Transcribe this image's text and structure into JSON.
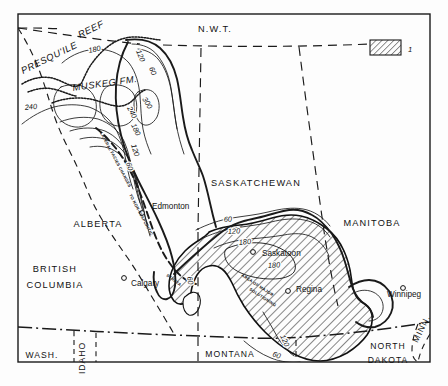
{
  "map": {
    "title": "Isopach map of Middle Devonian Elk Point evaporites, Western Canada Sedimentary Basin",
    "frame": {
      "x": 18,
      "y": 14,
      "width": 412,
      "height": 348
    },
    "legend": {
      "swatch_pattern": "diagonal-hatch",
      "label": "1"
    },
    "provinces": [
      {
        "name": "N.W.T.",
        "x": 215,
        "y": 32,
        "cls": "prov-label",
        "anchor": "middle"
      },
      {
        "name": "SASKATCHEWAN",
        "x": 256,
        "y": 186,
        "cls": "prov-label",
        "anchor": "middle"
      },
      {
        "name": "MANITOBA",
        "x": 372,
        "y": 226,
        "cls": "prov-label",
        "anchor": "middle"
      },
      {
        "name": "ALBERTA",
        "x": 98,
        "y": 227,
        "cls": "prov-label",
        "anchor": "middle"
      }
    ],
    "regions": [
      {
        "name": "BRITISH",
        "x": 55,
        "y": 272,
        "cls": "prov-label",
        "anchor": "middle"
      },
      {
        "name": "COLUMBIA",
        "x": 55,
        "y": 288,
        "cls": "prov-label",
        "anchor": "middle"
      }
    ],
    "states": [
      {
        "name": "WASH.",
        "x": 42,
        "y": 358,
        "cls": "state-label",
        "anchor": "middle"
      },
      {
        "name": "MONTANA",
        "x": 230,
        "y": 357,
        "cls": "state-label",
        "anchor": "middle",
        "spacing": 4.5
      },
      {
        "name": "NORTH",
        "x": 388,
        "y": 349,
        "cls": "state-label",
        "anchor": "middle"
      },
      {
        "name": "DAKOTA",
        "x": 388,
        "y": 363,
        "cls": "state-label",
        "anchor": "middle"
      }
    ],
    "rotated_states": [
      {
        "name": "IDAHO",
        "x": 85,
        "y": 358,
        "rotate": -90,
        "cls": "state-label"
      },
      {
        "name": "MINN.",
        "x": 424,
        "y": 330,
        "rotate": -64,
        "cls": "state-label"
      }
    ],
    "cities": [
      {
        "name": "Edmonton",
        "x": 152,
        "y": 209,
        "dot_x": 142,
        "dot_y": 213
      },
      {
        "name": "Calgary",
        "x": 131,
        "y": 286,
        "dot_x": 124,
        "dot_y": 278
      },
      {
        "name": "Saskatoon",
        "x": 262,
        "y": 256,
        "dot_x": 253,
        "dot_y": 252
      },
      {
        "name": "Regina",
        "x": 296,
        "y": 292,
        "dot_x": 288,
        "dot_y": 291
      },
      {
        "name": "Winnipeg",
        "x": 387,
        "y": 297,
        "dot_x": 403,
        "dot_y": 288
      }
    ],
    "features": [
      {
        "name": "PRESQU'ILE",
        "x": 23,
        "y": 74,
        "rotate": -26,
        "cls": "feature-label"
      },
      {
        "name": "REEF",
        "x": 80,
        "y": 38,
        "rotate": -26,
        "cls": "feature-label"
      },
      {
        "name": "MUSKEG FM.",
        "x": 73,
        "y": 91,
        "rotate": -8,
        "cls": "feature-label"
      }
    ],
    "annotations": [
      {
        "name": "LATERAL FACIES CHANGES",
        "x": 100,
        "y": 133,
        "rotate": 62,
        "cls": "tiny-label"
      },
      {
        "name": "TO NON-EVAPORITIC",
        "x": 129,
        "y": 195,
        "rotate": 62,
        "cls": "tiny-label"
      },
      {
        "name": "STRATA",
        "x": 166,
        "y": 276,
        "rotate": 36,
        "cls": "tiny-label"
      },
      {
        "name": "AREA OF MAJOR",
        "x": 241,
        "y": 276,
        "rotate": 33,
        "cls": "tiny-label"
      },
      {
        "name": "SOLUTIONING",
        "x": 249,
        "y": 290,
        "rotate": 33,
        "cls": "tiny-label"
      }
    ],
    "contour_labels": [
      {
        "value": "180",
        "x": 89,
        "y": 53,
        "rotate": -12
      },
      {
        "value": "120",
        "x": 136,
        "y": 51,
        "rotate": 68
      },
      {
        "value": "60",
        "x": 149,
        "y": 68,
        "rotate": 70
      },
      {
        "value": "240",
        "x": 25,
        "y": 110,
        "rotate": -6
      },
      {
        "value": "300",
        "x": 142,
        "y": 99,
        "rotate": 58
      },
      {
        "value": "240",
        "x": 127,
        "y": 108,
        "rotate": 62
      },
      {
        "value": "180",
        "x": 131,
        "y": 125,
        "rotate": 64
      },
      {
        "value": "120",
        "x": 131,
        "y": 145,
        "rotate": 72
      },
      {
        "value": "60",
        "x": 126,
        "y": 163,
        "rotate": 74
      },
      {
        "value": "60",
        "x": 224,
        "y": 222,
        "rotate": -4
      },
      {
        "value": "120",
        "x": 228,
        "y": 234,
        "rotate": -4
      },
      {
        "value": "180",
        "x": 239,
        "y": 245,
        "rotate": -6
      },
      {
        "value": "180",
        "x": 268,
        "y": 268,
        "rotate": -4
      },
      {
        "value": "60",
        "x": 187,
        "y": 277,
        "rotate": 78
      },
      {
        "value": "120",
        "x": 280,
        "y": 336,
        "rotate": 66
      },
      {
        "value": "60",
        "x": 272,
        "y": 356,
        "rotate": 20
      }
    ]
  }
}
